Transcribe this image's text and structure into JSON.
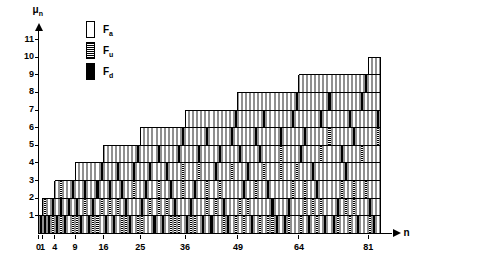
{
  "axes": {
    "y_name": "μ",
    "y_name_sub": "n",
    "x_name": "n",
    "y_ticks": [
      1,
      2,
      3,
      4,
      5,
      6,
      7,
      8,
      9,
      10,
      11
    ],
    "x_ticks": [
      0,
      1,
      4,
      9,
      16,
      25,
      36,
      49,
      64,
      81
    ],
    "x_tick_labels": [
      "0",
      "1",
      "4",
      "9",
      "16",
      "25",
      "36",
      "49",
      "64",
      "81"
    ],
    "x_min": 0,
    "x_max": 85,
    "y_min": 0,
    "y_max": 11
  },
  "legend": {
    "items": [
      {
        "key": "a",
        "label": "F",
        "sub": "a",
        "style": "empty",
        "color": "#ffffff"
      },
      {
        "key": "u",
        "label": "F",
        "sub": "u",
        "style": "hatched",
        "color": "#808080"
      },
      {
        "key": "d",
        "label": "F",
        "sub": "d",
        "style": "filled",
        "color": "#000000"
      }
    ]
  },
  "colors": {
    "empty": "#ffffff",
    "hatched": "#808080",
    "filled": "#000000",
    "grid": "#000000",
    "cell_border": "#909090",
    "axis": "#000000"
  },
  "chart_data": {
    "type": "heatmap",
    "title": "",
    "xlabel": "n",
    "ylabel": "μ_n",
    "xlim": [
      0,
      85
    ],
    "ylim": [
      0,
      11
    ],
    "grid": true,
    "legend_position": "top-left",
    "categories": [
      1,
      2,
      3,
      4,
      5,
      6,
      7,
      8,
      9,
      10,
      11,
      12,
      13,
      14,
      15,
      16,
      17,
      18,
      19,
      20,
      21,
      22,
      23,
      24,
      25,
      26,
      27,
      28,
      29,
      30,
      31,
      32,
      33,
      34,
      35,
      36,
      37,
      38,
      39,
      40,
      41,
      42,
      43,
      44,
      45,
      46,
      47,
      48,
      49,
      50,
      51,
      52,
      53,
      54,
      55,
      56,
      57,
      58,
      59,
      60,
      61,
      62,
      63,
      64,
      65,
      66,
      67,
      68,
      69,
      70,
      71,
      72,
      73,
      74,
      75,
      76,
      77,
      78,
      79,
      80,
      81,
      82,
      83,
      84
    ],
    "column_heights": [
      1,
      2,
      2,
      2,
      3,
      3,
      3,
      3,
      3,
      4,
      4,
      4,
      4,
      4,
      4,
      4,
      5,
      5,
      5,
      5,
      5,
      5,
      5,
      5,
      5,
      6,
      6,
      6,
      6,
      6,
      6,
      6,
      6,
      6,
      6,
      6,
      7,
      7,
      7,
      7,
      7,
      7,
      7,
      7,
      7,
      7,
      7,
      7,
      7,
      8,
      8,
      8,
      8,
      8,
      8,
      8,
      8,
      8,
      8,
      8,
      8,
      8,
      8,
      8,
      9,
      9,
      9,
      9,
      9,
      9,
      9,
      9,
      9,
      9,
      9,
      9,
      9,
      9,
      9,
      9,
      9,
      10,
      10,
      10
    ],
    "cells": {
      "1": {
        "d": [
          1
        ],
        "u": []
      },
      "2": {
        "d": [
          1
        ],
        "u": [
          2
        ]
      },
      "3": {
        "d": [
          1
        ],
        "u": []
      },
      "4": {
        "d": [
          2
        ],
        "u": [
          1
        ]
      },
      "5": {
        "d": [
          1
        ],
        "u": []
      },
      "6": {
        "d": [
          2
        ],
        "u": [
          1,
          3
        ]
      },
      "7": {
        "d": [
          1
        ],
        "u": []
      },
      "8": {
        "d": [
          2
        ],
        "u": []
      },
      "9": {
        "d": [
          3
        ],
        "u": [
          1
        ]
      },
      "10": {
        "d": [
          2
        ],
        "u": [
          1
        ]
      },
      "11": {
        "d": [
          1
        ],
        "u": []
      },
      "12": {
        "d": [
          3
        ],
        "u": [
          2
        ]
      },
      "13": {
        "d": [
          1
        ],
        "u": []
      },
      "14": {
        "d": [
          2
        ],
        "u": [
          1
        ]
      },
      "15": {
        "d": [
          3
        ],
        "u": [
          1
        ]
      },
      "16": {
        "d": [
          4
        ],
        "u": [
          2
        ]
      },
      "17": {
        "d": [
          1
        ],
        "u": []
      },
      "18": {
        "d": [
          3
        ],
        "u": [
          2
        ]
      },
      "19": {
        "d": [
          1
        ],
        "u": []
      },
      "20": {
        "d": [
          4
        ],
        "u": [
          2
        ]
      },
      "21": {
        "d": [
          3
        ],
        "u": [
          1
        ]
      },
      "22": {
        "d": [
          2
        ],
        "u": [
          1
        ]
      },
      "23": {
        "d": [
          1
        ],
        "u": []
      },
      "24": {
        "d": [
          4
        ],
        "u": [
          3
        ]
      },
      "25": {
        "d": [
          5
        ],
        "u": [
          1
        ]
      },
      "26": {
        "d": [
          2
        ],
        "u": [
          1
        ]
      },
      "27": {
        "d": [
          3
        ],
        "u": []
      },
      "28": {
        "d": [
          4
        ],
        "u": [
          2
        ]
      },
      "29": {
        "d": [
          1
        ],
        "u": []
      },
      "30": {
        "d": [
          5
        ],
        "u": [
          2,
          3
        ]
      },
      "31": {
        "d": [
          1
        ],
        "u": []
      },
      "32": {
        "d": [
          4
        ],
        "u": [
          2
        ]
      },
      "33": {
        "d": [
          3
        ],
        "u": [
          1
        ]
      },
      "34": {
        "d": [
          2
        ],
        "u": [
          1
        ]
      },
      "35": {
        "d": [
          5
        ],
        "u": [
          1
        ]
      },
      "36": {
        "d": [
          6
        ],
        "u": [
          3,
          4
        ]
      },
      "37": {
        "d": [
          1
        ],
        "u": []
      },
      "38": {
        "d": [
          2
        ],
        "u": [
          1
        ]
      },
      "39": {
        "d": [
          3
        ],
        "u": [
          1
        ]
      },
      "40": {
        "d": [
          5
        ],
        "u": [
          4
        ]
      },
      "41": {
        "d": [
          1
        ],
        "u": []
      },
      "42": {
        "d": [
          6
        ],
        "u": [
          2,
          3
        ]
      },
      "43": {
        "d": [
          1
        ],
        "u": []
      },
      "44": {
        "d": [
          4
        ],
        "u": [
          2
        ]
      },
      "45": {
        "d": [
          5
        ],
        "u": [
          3
        ]
      },
      "46": {
        "d": [
          2
        ],
        "u": [
          1
        ]
      },
      "47": {
        "d": [
          1
        ],
        "u": []
      },
      "48": {
        "d": [
          6
        ],
        "u": [
          4
        ]
      },
      "49": {
        "d": [
          7
        ],
        "u": [
          1
        ]
      },
      "50": {
        "d": [
          5
        ],
        "u": [
          2
        ]
      },
      "51": {
        "d": [
          3
        ],
        "u": [
          1
        ]
      },
      "52": {
        "d": [
          4
        ],
        "u": [
          2
        ]
      },
      "53": {
        "d": [
          1
        ],
        "u": []
      },
      "54": {
        "d": [
          6
        ],
        "u": [
          3
        ]
      },
      "55": {
        "d": [
          5
        ],
        "u": [
          1
        ]
      },
      "56": {
        "d": [
          7
        ],
        "u": [
          4
        ]
      },
      "57": {
        "d": [
          3
        ],
        "u": [
          1
        ]
      },
      "58": {
        "d": [
          2
        ],
        "u": [
          1
        ]
      },
      "59": {
        "d": [
          1
        ],
        "u": []
      },
      "60": {
        "d": [
          6
        ],
        "u": [
          4,
          5
        ]
      },
      "61": {
        "d": [
          1
        ],
        "u": []
      },
      "62": {
        "d": [
          2
        ],
        "u": [
          1
        ]
      },
      "63": {
        "d": [
          7
        ],
        "u": [
          3
        ]
      },
      "64": {
        "d": [
          8
        ],
        "u": [
          4
        ]
      },
      "65": {
        "d": [
          5
        ],
        "u": [
          1
        ]
      },
      "66": {
        "d": [
          6
        ],
        "u": [
          2,
          3
        ]
      },
      "67": {
        "d": [
          1
        ],
        "u": []
      },
      "68": {
        "d": [
          4
        ],
        "u": [
          2
        ]
      },
      "69": {
        "d": [
          3
        ],
        "u": [
          1
        ]
      },
      "70": {
        "d": [
          7
        ],
        "u": [
          2,
          5
        ]
      },
      "71": {
        "d": [
          1
        ],
        "u": []
      },
      "72": {
        "d": [
          8
        ],
        "u": [
          6
        ]
      },
      "73": {
        "d": [
          1
        ],
        "u": []
      },
      "74": {
        "d": [
          2
        ],
        "u": [
          1
        ]
      },
      "75": {
        "d": [
          5
        ],
        "u": [
          3
        ]
      },
      "76": {
        "d": [
          4
        ],
        "u": [
          2
        ]
      },
      "77": {
        "d": [
          7
        ],
        "u": [
          1
        ]
      },
      "78": {
        "d": [
          6
        ],
        "u": [
          2,
          3
        ]
      },
      "79": {
        "d": [
          1
        ],
        "u": []
      },
      "80": {
        "d": [
          8
        ],
        "u": [
          5
        ]
      },
      "81": {
        "d": [
          9
        ],
        "u": [
          3
        ]
      },
      "82": {
        "d": [
          2
        ],
        "u": [
          1
        ]
      },
      "83": {
        "d": [
          1
        ],
        "u": []
      },
      "84": {
        "d": [
          7
        ],
        "u": [
          6
        ]
      }
    }
  }
}
